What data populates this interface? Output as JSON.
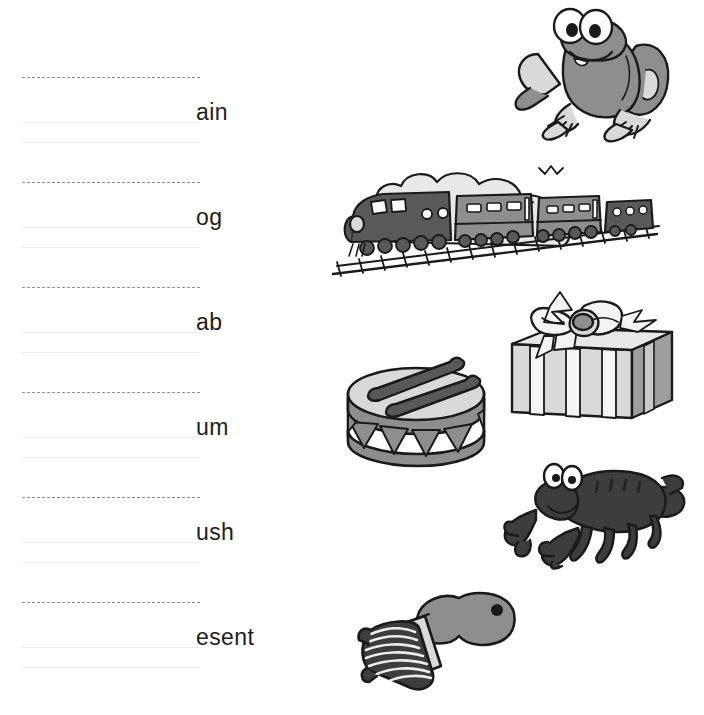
{
  "worksheet": {
    "type": "phonics-word-family-writing-practice",
    "background_color": "#ffffff",
    "line_color": "#8f8f8f",
    "faint_line_color": "#ececec",
    "text_color": "#1d1d1d",
    "illustration_colors": {
      "outline": "#1a1a1a",
      "mid_grey": "#8e8e8e",
      "light_grey": "#d9d9d9",
      "dark_grey": "#595959",
      "very_dark": "#3d3d3d",
      "white": "#ffffff"
    }
  },
  "rows": [
    {
      "id": "row-1",
      "ending": "ain",
      "answer_hint": "",
      "picture": "frog-illustration",
      "line_top": 77
    },
    {
      "id": "row-2",
      "ending": "og",
      "answer_hint": "",
      "picture": "train-illustration",
      "line_top": 182
    },
    {
      "id": "row-3",
      "ending": "ab",
      "answer_hint": "",
      "picture": "gift-illustration",
      "line_top": 287
    },
    {
      "id": "row-4",
      "ending": "um",
      "answer_hint": "",
      "picture": "drum-illustration",
      "line_top": 392
    },
    {
      "id": "row-5",
      "ending": "ush",
      "answer_hint": "",
      "picture": "crab-illustration",
      "line_top": 497
    },
    {
      "id": "row-6",
      "ending": "esent",
      "answer_hint": "",
      "picture": "brush-illustration",
      "line_top": 602
    }
  ],
  "illustrations": [
    {
      "name": "frog-illustration",
      "label": "frog",
      "x": 508,
      "y": 4,
      "w": 190,
      "h": 140
    },
    {
      "name": "train-illustration",
      "label": "train",
      "x": 331,
      "y": 162,
      "w": 330,
      "h": 118
    },
    {
      "name": "gift-illustration",
      "label": "present",
      "x": 492,
      "y": 288,
      "w": 186,
      "h": 136
    },
    {
      "name": "drum-illustration",
      "label": "drum",
      "x": 334,
      "y": 344,
      "w": 176,
      "h": 126
    },
    {
      "name": "crab-illustration",
      "label": "crab",
      "x": 502,
      "y": 458,
      "w": 188,
      "h": 112
    },
    {
      "name": "brush-illustration",
      "label": "brush",
      "x": 357,
      "y": 588,
      "w": 172,
      "h": 108
    }
  ]
}
